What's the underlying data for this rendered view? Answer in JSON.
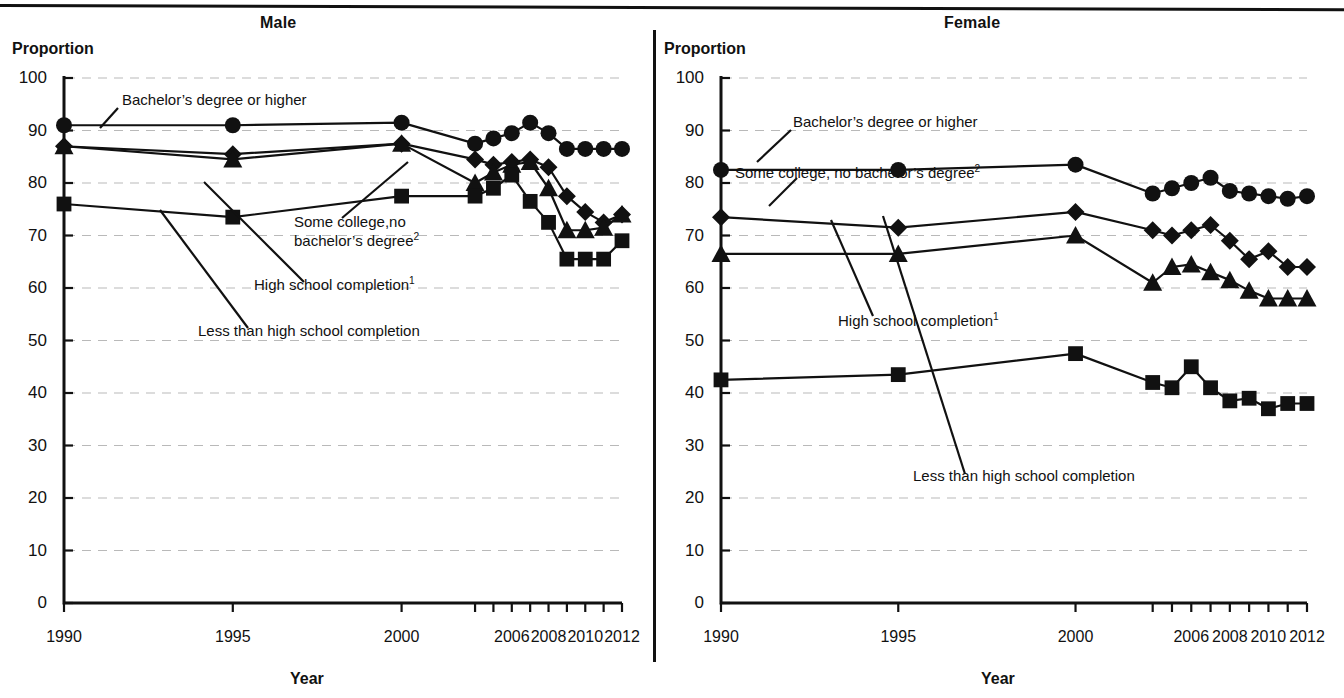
{
  "figure": {
    "panels": [
      "Male",
      "Female"
    ],
    "y_axis_label": "Proportion",
    "x_axis_label": "Year",
    "accent_color": "#111111",
    "grid_color": "#b9b9b9"
  },
  "male": {
    "title": "Male",
    "ylabel": "Proportion",
    "xlabel": "Year",
    "yticks": [
      "0",
      "10",
      "20",
      "30",
      "40",
      "50",
      "60",
      "70",
      "80",
      "90",
      "100"
    ],
    "xticks": [
      "1990",
      "1995",
      "2000",
      "2006",
      "2008",
      "2010",
      "2012"
    ],
    "annotations": {
      "bachelor": "Bachelor’s degree or higher",
      "some_college_line1": "Some college,no",
      "some_college_line2": "bachelor’s degree",
      "some_college_sup": "2",
      "high_school": "High school completion",
      "high_school_sup": "1",
      "less_than_hs": "Less than high school completion"
    }
  },
  "female": {
    "title": "Female",
    "ylabel": "Proportion",
    "xlabel": "Year",
    "yticks": [
      "0",
      "10",
      "20",
      "30",
      "40",
      "50",
      "60",
      "70",
      "80",
      "90",
      "100"
    ],
    "xticks": [
      "1990",
      "1995",
      "2000",
      "2006",
      "2008",
      "2010",
      "2012"
    ],
    "annotations": {
      "bachelor": "Bachelor’s degree or higher",
      "some_college": "Some college, no bachelor’s degree",
      "some_college_sup": "2",
      "high_school": "High school completion",
      "high_school_sup": "1",
      "less_than_hs": "Less than high school completion"
    }
  },
  "chart_data": [
    {
      "type": "line",
      "title": "Male",
      "xlabel": "Year",
      "ylabel": "Proportion",
      "ylim": [
        0,
        100
      ],
      "ytick_values": [
        0,
        10,
        20,
        30,
        40,
        50,
        60,
        70,
        80,
        90,
        100
      ],
      "grid": true,
      "legend": "inline-annotations",
      "x": [
        1990,
        1995,
        2000,
        2004,
        2005,
        2006,
        2007,
        2008,
        2009,
        2010,
        2011,
        2012
      ],
      "xtick_labels": [
        "1990",
        "1995",
        "2000",
        "2006",
        "2008",
        "2010",
        "2012"
      ],
      "xtick_values": [
        1990,
        1995,
        2000,
        2006,
        2008,
        2010,
        2012
      ],
      "series": [
        {
          "name": "Bachelor’s degree or higher",
          "marker": "circle",
          "values": [
            91.0,
            91.0,
            91.5,
            87.5,
            88.5,
            89.5,
            91.5,
            89.5,
            86.5,
            86.5,
            86.5,
            86.5
          ]
        },
        {
          "name": "Some college, no bachelor’s degree",
          "marker": "diamond",
          "values": [
            87.0,
            85.5,
            87.5,
            84.5,
            83.5,
            84.0,
            84.5,
            83.0,
            77.5,
            74.5,
            72.5,
            74.0
          ]
        },
        {
          "name": "High school completion",
          "marker": "triangle",
          "values": [
            87.0,
            84.5,
            87.5,
            80.0,
            82.0,
            83.5,
            84.0,
            79.0,
            71.0,
            71.0,
            71.5,
            74.0
          ]
        },
        {
          "name": "Less than high school completion",
          "marker": "square",
          "values": [
            76.0,
            73.5,
            77.5,
            77.5,
            79.0,
            81.5,
            76.5,
            72.5,
            65.5,
            65.5,
            65.5,
            69.0
          ]
        }
      ]
    },
    {
      "type": "line",
      "title": "Female",
      "xlabel": "Year",
      "ylabel": "Proportion",
      "ylim": [
        0,
        100
      ],
      "ytick_values": [
        0,
        10,
        20,
        30,
        40,
        50,
        60,
        70,
        80,
        90,
        100
      ],
      "grid": true,
      "legend": "inline-annotations",
      "x": [
        1990,
        1995,
        2000,
        2004,
        2005,
        2006,
        2007,
        2008,
        2009,
        2010,
        2011,
        2012
      ],
      "xtick_labels": [
        "1990",
        "1995",
        "2000",
        "2006",
        "2008",
        "2010",
        "2012"
      ],
      "xtick_values": [
        1990,
        1995,
        2000,
        2006,
        2008,
        2010,
        2012
      ],
      "series": [
        {
          "name": "Bachelor’s degree or higher",
          "marker": "circle",
          "values": [
            82.5,
            82.5,
            83.5,
            78.0,
            79.0,
            80.0,
            81.0,
            78.5,
            78.0,
            77.5,
            77.0,
            77.5
          ]
        },
        {
          "name": "Some college, no bachelor’s degree",
          "marker": "diamond",
          "values": [
            73.5,
            71.5,
            74.5,
            71.0,
            70.0,
            71.0,
            72.0,
            69.0,
            65.5,
            67.0,
            64.0,
            64.0
          ]
        },
        {
          "name": "High school completion",
          "marker": "triangle",
          "values": [
            66.5,
            66.5,
            70.0,
            61.0,
            64.0,
            64.5,
            63.0,
            61.5,
            59.5,
            58.0,
            58.0,
            58.0
          ]
        },
        {
          "name": "Less than high school completion",
          "marker": "square",
          "values": [
            42.5,
            43.5,
            47.5,
            42.0,
            41.0,
            45.0,
            41.0,
            38.5,
            39.0,
            37.0,
            38.0,
            38.0
          ]
        }
      ]
    }
  ]
}
